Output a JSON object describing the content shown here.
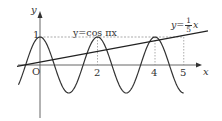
{
  "figure": {
    "axes": {
      "x_label": "x",
      "y_label": "y",
      "origin_label": "O"
    },
    "ticks": {
      "y_one": "1",
      "x_two": "2",
      "x_four": "4",
      "x_five": "5"
    },
    "curves": [
      {
        "name": "cosine",
        "label": "y=cos πx"
      },
      {
        "name": "line",
        "label_prefix": "y=",
        "fraction_num": "1",
        "fraction_den": "5",
        "label_suffix": "x"
      }
    ],
    "colors": {
      "stroke": "#333333",
      "guide": "#888888"
    }
  }
}
